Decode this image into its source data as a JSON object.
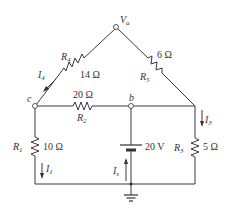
{
  "nodes": {
    "a": {
      "label": "V",
      "sub": "a"
    },
    "b": {
      "label": "b"
    },
    "c": {
      "label": "c"
    }
  },
  "resistors": [
    {
      "id": "R1",
      "name": "R",
      "sub": "1",
      "value": "10 Ω"
    },
    {
      "id": "R2",
      "name": "R",
      "sub": "2",
      "value": "20 Ω"
    },
    {
      "id": "R3",
      "name": "R",
      "sub": "3",
      "value": "5 Ω"
    },
    {
      "id": "R4",
      "name": "R",
      "sub": "4",
      "value": "14 Ω"
    },
    {
      "id": "R5",
      "name": "R",
      "sub": "5",
      "value": "6 Ω"
    }
  ],
  "source": {
    "value": "20 V"
  },
  "currents": [
    {
      "id": "I1",
      "name": "I",
      "sub": "1"
    },
    {
      "id": "I3",
      "name": "I",
      "sub": "3"
    },
    {
      "id": "I4",
      "name": "I",
      "sub": "4"
    },
    {
      "id": "Is",
      "name": "I",
      "sub": "s"
    }
  ]
}
